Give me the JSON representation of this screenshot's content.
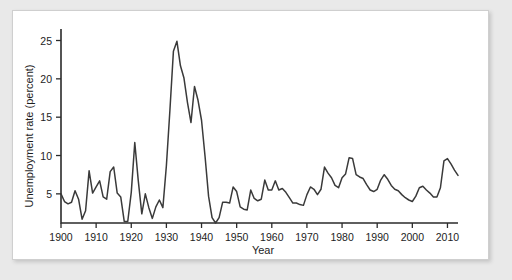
{
  "figure": {
    "background_color": "#ffffff",
    "page_background_color": "#e9e9e9",
    "border_color": "#cfcfcf"
  },
  "chart_data": {
    "type": "line",
    "title": "",
    "xlabel": "Year",
    "ylabel": "Unemployment rate (percent)",
    "xlim": [
      1900,
      2013
    ],
    "ylim": [
      1.2,
      26.5
    ],
    "grid": false,
    "legend": null,
    "line_color": "#3a3a3a",
    "xticks": [
      1900,
      1910,
      1920,
      1930,
      1940,
      1950,
      1960,
      1970,
      1980,
      1990,
      2000,
      2010
    ],
    "xtick_labels": [
      "1900",
      "1910",
      "1920",
      "1930",
      "1940",
      "1950",
      "1960",
      "1970",
      "1980",
      "1990",
      "2000",
      "2010"
    ],
    "yticks": [
      5,
      10,
      15,
      20,
      25
    ],
    "ytick_labels": [
      "5",
      "10",
      "15",
      "20",
      "25"
    ],
    "series": [
      {
        "name": "Unemployment rate",
        "x": [
          1900,
          1901,
          1902,
          1903,
          1904,
          1905,
          1906,
          1907,
          1908,
          1909,
          1910,
          1911,
          1912,
          1913,
          1914,
          1915,
          1916,
          1917,
          1918,
          1919,
          1920,
          1921,
          1922,
          1923,
          1924,
          1925,
          1926,
          1927,
          1928,
          1929,
          1930,
          1931,
          1932,
          1933,
          1934,
          1935,
          1936,
          1937,
          1938,
          1939,
          1940,
          1941,
          1942,
          1943,
          1944,
          1945,
          1946,
          1947,
          1948,
          1949,
          1950,
          1951,
          1952,
          1953,
          1954,
          1955,
          1956,
          1957,
          1958,
          1959,
          1960,
          1961,
          1962,
          1963,
          1964,
          1965,
          1966,
          1967,
          1968,
          1969,
          1970,
          1971,
          1972,
          1973,
          1974,
          1975,
          1976,
          1977,
          1978,
          1979,
          1980,
          1981,
          1982,
          1983,
          1984,
          1985,
          1986,
          1987,
          1988,
          1989,
          1990,
          1991,
          1992,
          1993,
          1994,
          1995,
          1996,
          1997,
          1998,
          1999,
          2000,
          2001,
          2002,
          2003,
          2004,
          2005,
          2006,
          2007,
          2008,
          2009,
          2010,
          2011,
          2012,
          2013
        ],
        "values": [
          5.0,
          4.0,
          3.7,
          3.9,
          5.4,
          4.3,
          1.7,
          2.8,
          8.0,
          5.1,
          5.9,
          6.7,
          4.6,
          4.3,
          7.9,
          8.5,
          5.1,
          4.6,
          1.4,
          1.4,
          5.2,
          11.7,
          6.7,
          2.4,
          5.0,
          3.2,
          1.8,
          3.3,
          4.2,
          3.2,
          8.7,
          15.9,
          23.6,
          24.9,
          21.7,
          20.1,
          16.9,
          14.3,
          19.0,
          17.2,
          14.6,
          9.9,
          4.7,
          1.9,
          1.2,
          1.9,
          3.9,
          3.9,
          3.8,
          5.9,
          5.3,
          3.3,
          3.0,
          2.9,
          5.5,
          4.4,
          4.1,
          4.3,
          6.8,
          5.5,
          5.5,
          6.7,
          5.5,
          5.7,
          5.2,
          4.5,
          3.8,
          3.8,
          3.6,
          3.5,
          4.9,
          5.9,
          5.6,
          4.9,
          5.6,
          8.5,
          7.7,
          7.1,
          6.1,
          5.8,
          7.1,
          7.6,
          9.7,
          9.6,
          7.5,
          7.2,
          7.0,
          6.2,
          5.5,
          5.3,
          5.6,
          6.8,
          7.5,
          6.9,
          6.1,
          5.6,
          5.4,
          4.9,
          4.5,
          4.2,
          4.0,
          4.7,
          5.8,
          6.0,
          5.5,
          5.1,
          4.6,
          4.6,
          5.8,
          9.3,
          9.6,
          8.9,
          8.1,
          7.4
        ]
      }
    ]
  }
}
